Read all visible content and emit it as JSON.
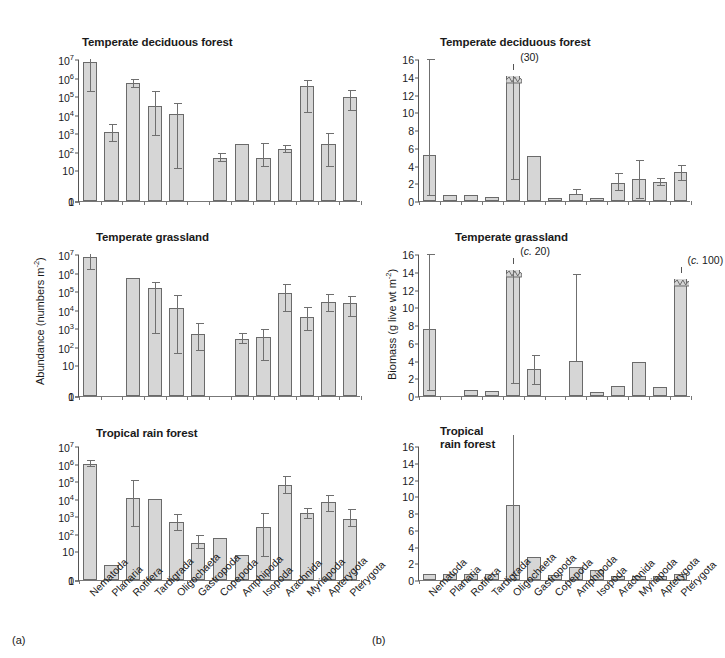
{
  "figure": {
    "panel_letter_left": "(a)",
    "panel_letter_right": "(b)"
  },
  "categories": [
    "Nematoda",
    "Planaria",
    "Rotifera",
    "Tardigrada",
    "Oligochaeta",
    "Gastropoda",
    "Copepoda",
    "Amphipoda",
    "Isopoda",
    "Arachnida",
    "Myriapoda",
    "Apterygota",
    "Pterygota"
  ],
  "abundance": {
    "axis_title": "Abundance (numbers m",
    "axis_title_sup": "-2",
    "axis_title_end": ")",
    "tick_labels": [
      "0",
      "1",
      "10",
      "10",
      "10",
      "10",
      "10",
      "10",
      "10"
    ],
    "tick_sups": [
      "",
      "",
      "",
      "2",
      "3",
      "4",
      "5",
      "6",
      "7"
    ]
  },
  "biomass": {
    "axis_title": "Biomass (g live wt m",
    "axis_title_sup": "-2",
    "axis_title_end": ")",
    "tick_labels": [
      "0",
      "2",
      "4",
      "6",
      "8",
      "10",
      "12",
      "14",
      "16"
    ]
  },
  "titles": {
    "deciduous": "Temperate deciduous forest",
    "grassland": "Temperate grassland",
    "tropical": "Tropical rain forest",
    "tropical_wrapped": "Tropical\nrain forest"
  },
  "annotations": {
    "deciduous_tardigrada": "(30)",
    "grassland_tardigrada": "(c. 20)",
    "grassland_tardigrada_italic": "c.",
    "grassland_tardigrada_num": " 20)",
    "grassland_pterygota": "(c. 100)",
    "grassland_pterygota_num": " 100)"
  },
  "chart_data": [
    {
      "type": "bar",
      "title": "Temperate deciduous forest",
      "panel": "a-top",
      "ylabel": "Abundance (numbers m^-2)",
      "xlabel": "",
      "yscale": "log-with-zero",
      "ylim": [
        0,
        7
      ],
      "yticks": [
        0,
        1,
        10,
        100,
        1000,
        10000,
        100000,
        1000000,
        10000000
      ],
      "categories": [
        "Nematoda",
        "Planaria",
        "Rotifera",
        "Tardigrada",
        "Oligochaeta",
        "Gastropoda",
        "Copepoda",
        "Amphipoda",
        "Isopoda",
        "Arachnida",
        "Myriapoda",
        "Apterygota",
        "Pterygota"
      ],
      "values_log10": [
        6.85,
        3.05,
        5.7,
        4.45,
        4.05,
        null,
        1.65,
        2.4,
        1.65,
        2.15,
        5.55,
        2.4,
        4.95
      ],
      "err_low_log10": [
        5.2,
        2.55,
        5.45,
        2.85,
        1.1,
        null,
        1.45,
        null,
        1.2,
        1.95,
        4.1,
        1.2,
        4.2
      ],
      "err_high_log10": [
        7.15,
        3.5,
        5.95,
        5.25,
        4.65,
        null,
        1.95,
        null,
        2.5,
        2.35,
        5.85,
        3.0,
        5.35
      ],
      "notes": "Gastropoda absent; log scale with linear 0-1 segment at base"
    },
    {
      "type": "bar",
      "title": "Temperate grassland",
      "panel": "a-middle",
      "ylabel": "Abundance (numbers m^-2)",
      "yscale": "log-with-zero",
      "ylim": [
        0,
        7
      ],
      "yticks": [
        0,
        1,
        10,
        100,
        1000,
        10000,
        100000,
        1000000,
        10000000
      ],
      "categories": [
        "Nematoda",
        "Planaria",
        "Rotifera",
        "Tardigrada",
        "Oligochaeta",
        "Gastropoda",
        "Copepoda",
        "Amphipoda",
        "Isopoda",
        "Arachnida",
        "Myriapoda",
        "Apterygota",
        "Pterygota"
      ],
      "values_log10": [
        6.85,
        null,
        5.7,
        5.15,
        4.1,
        2.7,
        null,
        2.4,
        2.55,
        4.9,
        3.6,
        4.4,
        4.35
      ],
      "err_low_log10": [
        6.15,
        null,
        null,
        2.7,
        1.6,
        1.75,
        null,
        2.15,
        1.25,
        3.85,
        2.85,
        3.85,
        3.6
      ],
      "err_high_log10": [
        7.2,
        null,
        null,
        5.5,
        4.8,
        3.3,
        null,
        2.75,
        2.95,
        5.4,
        4.15,
        4.85,
        4.75
      ],
      "notes": "Planaria and Copepoda absent"
    },
    {
      "type": "bar",
      "title": "Tropical rain forest",
      "panel": "a-bottom",
      "ylabel": "Abundance (numbers m^-2)",
      "yscale": "log-with-zero",
      "ylim": [
        0,
        7
      ],
      "yticks": [
        0,
        1,
        10,
        100,
        1000,
        10000,
        100000,
        1000000,
        10000000
      ],
      "categories": [
        "Nematoda",
        "Planaria",
        "Rotifera",
        "Tardigrada",
        "Oligochaeta",
        "Gastropoda",
        "Copepoda",
        "Amphipoda",
        "Isopoda",
        "Arachnida",
        "Myriapoda",
        "Apterygota",
        "Pterygota"
      ],
      "values_log10": [
        6.0,
        0.2,
        4.05,
        4.0,
        2.65,
        1.45,
        1.75,
        0.75,
        2.35,
        4.75,
        3.15,
        3.8,
        2.85
      ],
      "err_low_log10": [
        5.8,
        null,
        2.4,
        null,
        2.15,
        1.1,
        null,
        null,
        0.65,
        4.25,
        2.85,
        3.25,
        2.35
      ],
      "err_high_log10": [
        6.2,
        null,
        5.05,
        null,
        3.1,
        1.9,
        null,
        null,
        3.15,
        5.3,
        3.45,
        4.2,
        3.4
      ],
      "notes": "All 13 taxa present"
    },
    {
      "type": "bar",
      "title": "Temperate deciduous forest",
      "panel": "b-top",
      "ylabel": "Biomass (g live wt m^-2)",
      "ylim": [
        0,
        16
      ],
      "yticks": [
        0,
        2,
        4,
        6,
        8,
        10,
        12,
        14,
        16
      ],
      "categories": [
        "Nematoda",
        "Planaria",
        "Rotifera",
        "Tardigrada",
        "Oligochaeta",
        "Gastropoda",
        "Copepoda",
        "Amphipoda",
        "Isopoda",
        "Arachnida",
        "Myriapoda",
        "Apterygota",
        "Pterygota"
      ],
      "values": [
        5.2,
        0.7,
        0.7,
        0.45,
        30,
        5.1,
        0.35,
        0.8,
        0.35,
        2.0,
        2.5,
        2.1,
        3.25
      ],
      "err_low": [
        0.6,
        null,
        null,
        null,
        2.4,
        null,
        null,
        null,
        null,
        1.1,
        0.2,
        1.7,
        2.3
      ],
      "err_high": [
        16.0,
        null,
        null,
        null,
        null,
        null,
        null,
        1.35,
        null,
        3.2,
        4.6,
        2.6,
        4.1
      ],
      "broken_bars": [
        {
          "category": "Oligochaeta",
          "displayed_to": 14.1,
          "true_value": 30,
          "label": "(30)"
        }
      ],
      "notes": "Oligochaeta bar truncated at 14.1 with (30) annotation"
    },
    {
      "type": "bar",
      "title": "Temperate grassland",
      "panel": "b-middle",
      "ylabel": "Biomass (g live wt m^-2)",
      "ylim": [
        0,
        16
      ],
      "yticks": [
        0,
        2,
        4,
        6,
        8,
        10,
        12,
        14,
        16
      ],
      "categories": [
        "Nematoda",
        "Planaria",
        "Rotifera",
        "Tardigrada",
        "Oligochaeta",
        "Gastropoda",
        "Copepoda",
        "Amphipoda",
        "Isopoda",
        "Arachnida",
        "Myriapoda",
        "Apterygota",
        "Pterygota"
      ],
      "values": [
        7.6,
        null,
        0.7,
        0.55,
        20,
        3.1,
        null,
        4.0,
        0.45,
        1.15,
        3.8,
        1.0,
        100
      ],
      "err_low": [
        0.6,
        null,
        null,
        null,
        1.35,
        1.25,
        null,
        null,
        null,
        null,
        null,
        null,
        null
      ],
      "err_high": [
        16.2,
        null,
        null,
        null,
        null,
        4.6,
        null,
        13.8,
        null,
        null,
        null,
        null,
        null
      ],
      "broken_bars": [
        {
          "category": "Oligochaeta",
          "displayed_to": 14.2,
          "true_value": 20,
          "label": "(c. 20)"
        },
        {
          "category": "Pterygota",
          "displayed_to": 13.2,
          "true_value": 100,
          "label": "(c. 100)"
        }
      ],
      "notes": "Planaria and Copepoda absent; two truncated bars"
    },
    {
      "type": "bar",
      "title": "Tropical rain forest",
      "panel": "b-bottom",
      "ylabel": "Biomass (g live wt m^-2)",
      "ylim": [
        0,
        16
      ],
      "yticks": [
        0,
        2,
        4,
        6,
        8,
        10,
        12,
        14,
        16
      ],
      "categories": [
        "Nematoda",
        "Planaria",
        "Rotifera",
        "Tardigrada",
        "Oligochaeta",
        "Gastropoda",
        "Copepoda",
        "Amphipoda",
        "Isopoda",
        "Arachnida",
        "Myriapoda",
        "Apterygota",
        "Pterygota"
      ],
      "values": [
        0.75,
        0.75,
        0.75,
        0.75,
        8.95,
        2.75,
        0.65,
        1.55,
        1.25,
        0.5,
        0.5,
        0.5,
        0.7
      ],
      "err_low": [
        null,
        null,
        null,
        null,
        0.45,
        null,
        null,
        null,
        null,
        null,
        null,
        null,
        null
      ],
      "err_high": [
        null,
        null,
        null,
        null,
        17.3,
        null,
        null,
        null,
        null,
        null,
        null,
        null,
        null
      ],
      "notes": "Oligochaeta dominant with very large error bar exceeding axis"
    }
  ],
  "colors": {
    "bar_fill": "#d6d6d6",
    "bar_stroke": "#6a6a6a",
    "axis": "#555555",
    "text": "#1a1a1a"
  }
}
